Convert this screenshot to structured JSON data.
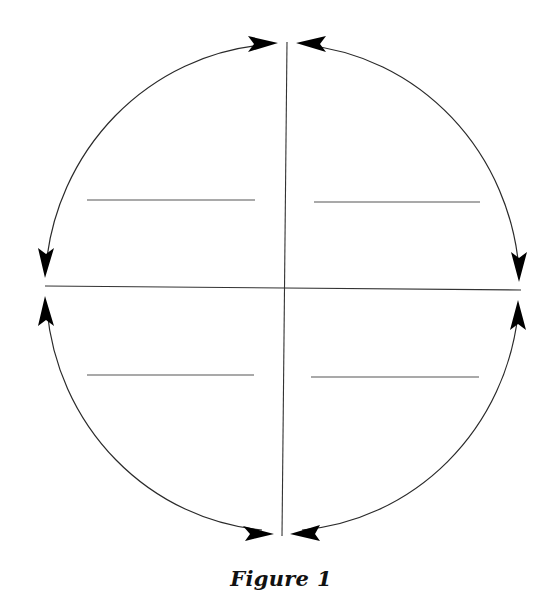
{
  "figure": {
    "caption": "Figure 1",
    "colors": {
      "stroke": "#2a2a2a",
      "arrowhead": "#000000",
      "blank_line": "#555555",
      "background": "#ffffff"
    },
    "circle": {
      "shape": "circle",
      "divided_into_quadrants": 4,
      "arrowheads_per_arc_end": 2,
      "arcs": [
        {
          "name": "top-left-arc",
          "from": "top",
          "to": "left"
        },
        {
          "name": "top-right-arc",
          "from": "top",
          "to": "right"
        },
        {
          "name": "bottom-left-arc",
          "from": "bottom",
          "to": "left"
        },
        {
          "name": "bottom-right-arc",
          "from": "bottom",
          "to": "right"
        }
      ]
    },
    "quadrants": [
      {
        "position": "top-left",
        "blank_line": true,
        "text": ""
      },
      {
        "position": "top-right",
        "blank_line": true,
        "text": ""
      },
      {
        "position": "bottom-left",
        "blank_line": true,
        "text": ""
      },
      {
        "position": "bottom-right",
        "blank_line": true,
        "text": ""
      }
    ]
  }
}
